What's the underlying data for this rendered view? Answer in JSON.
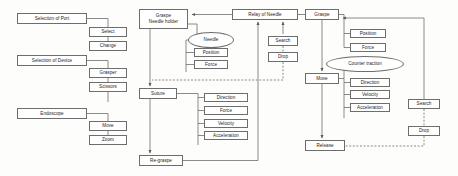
{
  "diagram": {
    "type": "flowchart",
    "title": "",
    "columns": [
      {
        "name": "setup-column",
        "nodes": [
          {
            "id": "selection-of-port",
            "label": "Selection of Port",
            "shape": "rect",
            "x": 17,
            "y": 13,
            "w": 70,
            "h": 11
          },
          {
            "id": "select",
            "label": "Select",
            "shape": "rect",
            "x": 89,
            "y": 27,
            "w": 38,
            "h": 10
          },
          {
            "id": "change",
            "label": "Change",
            "shape": "rect",
            "x": 89,
            "y": 41,
            "w": 38,
            "h": 10
          },
          {
            "id": "selection-of-device",
            "label": "Selection of Device",
            "shape": "rect",
            "x": 17,
            "y": 55,
            "w": 70,
            "h": 11
          },
          {
            "id": "grasper",
            "label": "Grasper",
            "shape": "rect",
            "x": 89,
            "y": 68,
            "w": 38,
            "h": 10
          },
          {
            "id": "scissors",
            "label": "Scissors",
            "shape": "rect",
            "x": 89,
            "y": 82,
            "w": 38,
            "h": 10
          },
          {
            "id": "endoscope",
            "label": "Endoscope",
            "shape": "rect",
            "x": 17,
            "y": 108,
            "w": 70,
            "h": 11
          },
          {
            "id": "move-endoscope",
            "label": "Move",
            "shape": "rect",
            "x": 89,
            "y": 121,
            "w": 38,
            "h": 10
          },
          {
            "id": "zoom",
            "label": "Zoom",
            "shape": "rect",
            "x": 89,
            "y": 135,
            "w": 38,
            "h": 10
          }
        ]
      },
      {
        "name": "needle-column",
        "nodes": [
          {
            "id": "graspe-needle-holder",
            "label": "Graspe\nNeedle holder",
            "shape": "rect",
            "x": 139,
            "y": 9,
            "w": 49,
            "h": 20
          },
          {
            "id": "needle",
            "label": "Needle",
            "shape": "ellipse",
            "x": 188,
            "y": 32,
            "w": 46,
            "h": 16
          },
          {
            "id": "position-needle",
            "label": "Position",
            "shape": "rect",
            "x": 194,
            "y": 48,
            "w": 34,
            "h": 9
          },
          {
            "id": "force-needle",
            "label": "Force",
            "shape": "rect",
            "x": 194,
            "y": 60,
            "w": 34,
            "h": 9
          },
          {
            "id": "relay-of-needle",
            "label": "Relay of Needle",
            "shape": "rect",
            "x": 232,
            "y": 9,
            "w": 66,
            "h": 11
          },
          {
            "id": "search-needle",
            "label": "Search",
            "shape": "rect",
            "x": 268,
            "y": 36,
            "w": 30,
            "h": 10
          },
          {
            "id": "drop-needle",
            "label": "Drop",
            "shape": "rect",
            "x": 268,
            "y": 52,
            "w": 30,
            "h": 10
          },
          {
            "id": "suture",
            "label": "Suture",
            "shape": "rect",
            "x": 139,
            "y": 88,
            "w": 38,
            "h": 11
          },
          {
            "id": "direction-suture",
            "label": "Direction",
            "shape": "rect",
            "x": 204,
            "y": 93,
            "w": 44,
            "h": 9
          },
          {
            "id": "force-suture",
            "label": "Force",
            "shape": "rect",
            "x": 204,
            "y": 106,
            "w": 44,
            "h": 9
          },
          {
            "id": "velocity-suture",
            "label": "Velocity",
            "shape": "rect",
            "x": 204,
            "y": 119,
            "w": 44,
            "h": 9
          },
          {
            "id": "acceleration-suture",
            "label": "Acceleration",
            "shape": "rect",
            "x": 204,
            "y": 131,
            "w": 44,
            "h": 9
          },
          {
            "id": "re-graspe",
            "label": "Re-graspe",
            "shape": "rect",
            "x": 139,
            "y": 155,
            "w": 44,
            "h": 11
          }
        ]
      },
      {
        "name": "traction-column",
        "nodes": [
          {
            "id": "graspe",
            "label": "Graspe",
            "shape": "rect",
            "x": 305,
            "y": 9,
            "w": 34,
            "h": 11
          },
          {
            "id": "position-graspe",
            "label": "Position",
            "shape": "rect",
            "x": 350,
            "y": 29,
            "w": 36,
            "h": 9
          },
          {
            "id": "force-graspe",
            "label": "Force",
            "shape": "rect",
            "x": 350,
            "y": 43,
            "w": 36,
            "h": 9
          },
          {
            "id": "counter-traction",
            "label": "Counter traction",
            "shape": "ellipse",
            "x": 326,
            "y": 56,
            "w": 78,
            "h": 16
          },
          {
            "id": "move-traction",
            "label": "Move",
            "shape": "rect",
            "x": 305,
            "y": 73,
            "w": 34,
            "h": 11
          },
          {
            "id": "direction-traction",
            "label": "Direction",
            "shape": "rect",
            "x": 350,
            "y": 78,
            "w": 40,
            "h": 9
          },
          {
            "id": "velocity-traction",
            "label": "Velocity",
            "shape": "rect",
            "x": 350,
            "y": 90,
            "w": 40,
            "h": 9
          },
          {
            "id": "acceleration-traction",
            "label": "Acceleration",
            "shape": "rect",
            "x": 350,
            "y": 103,
            "w": 40,
            "h": 9
          },
          {
            "id": "search-traction",
            "label": "Search",
            "shape": "rect",
            "x": 408,
            "y": 99,
            "w": 32,
            "h": 10
          },
          {
            "id": "drop-traction",
            "label": "Drop",
            "shape": "rect",
            "x": 408,
            "y": 126,
            "w": 32,
            "h": 10
          },
          {
            "id": "release",
            "label": "Release",
            "shape": "rect",
            "x": 305,
            "y": 140,
            "w": 40,
            "h": 11
          }
        ]
      }
    ],
    "connector_style": {
      "solid_color": "#5f5f5f",
      "dashed_color": "#5f5f5f",
      "arrow_color": "#5a5a5a"
    }
  }
}
